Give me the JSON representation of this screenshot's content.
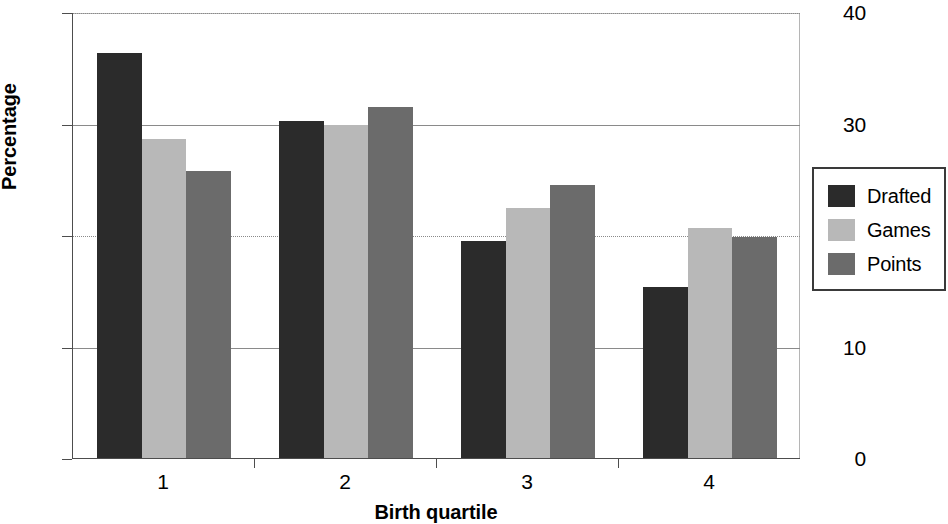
{
  "chart_data": {
    "type": "bar",
    "title": "",
    "xlabel": "Birth quartile",
    "ylabel": "Percentage",
    "categories": [
      "1",
      "2",
      "3",
      "4"
    ],
    "series": [
      {
        "name": "Drafted",
        "color": "#2b2b2b",
        "values": [
          36.3,
          30.2,
          19.5,
          15.3
        ]
      },
      {
        "name": "Games",
        "color": "#b8b8b8",
        "values": [
          28.6,
          29.9,
          22.4,
          20.6
        ]
      },
      {
        "name": "Points",
        "color": "#6b6b6b",
        "values": [
          25.7,
          31.5,
          24.5,
          19.8
        ]
      }
    ],
    "ylim": [
      0,
      40
    ],
    "yticks": [
      0,
      10,
      20,
      30,
      40
    ],
    "ytick_labels": [
      "0",
      "10",
      "20",
      "30",
      "40"
    ],
    "grid": true,
    "legend_position": "right"
  },
  "axes": {
    "y_title": "Percentage",
    "x_title": "Birth quartile"
  },
  "legend": {
    "entries": [
      {
        "label": "Drafted"
      },
      {
        "label": "Games"
      },
      {
        "label": "Points"
      }
    ]
  }
}
